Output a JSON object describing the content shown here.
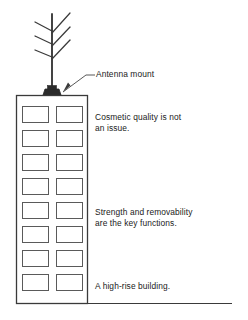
{
  "diagram": {
    "background_color": "#ffffff",
    "line_color": "#3a3a3a",
    "text_color": "#1a1a1a",
    "mount_fill_color": "#2b2b2b"
  },
  "labels": {
    "antenna_mount": "Antenna mount"
  },
  "notes": [
    {
      "id": "cosmetic",
      "text": "Cosmetic quality is not\nan issue."
    },
    {
      "id": "strength",
      "text": "Strength and removability\nare the key functions."
    },
    {
      "id": "highrise",
      "text": "A high-rise building."
    }
  ],
  "building": {
    "window_rows": 8,
    "window_columns": 2,
    "window_count": 16
  }
}
